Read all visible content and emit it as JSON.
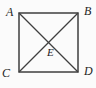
{
  "figure": {
    "type": "geometry-diagram",
    "labels": {
      "top_left": "A",
      "top_right": "B",
      "bottom_left": "C",
      "bottom_right": "D",
      "center": "E"
    },
    "colors": {
      "line": "#3f3f3f",
      "text": "#1e1e1e",
      "background": "#fbfbfb"
    }
  }
}
